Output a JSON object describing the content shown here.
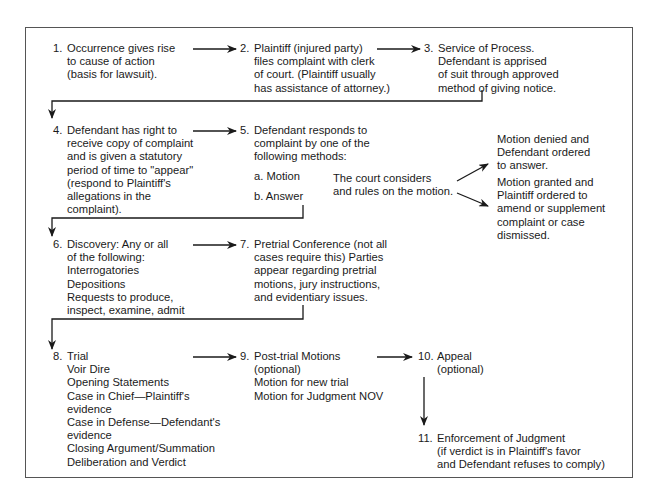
{
  "diagram": {
    "steps": [
      {
        "id": 1,
        "num": "1.",
        "lines": [
          "Occurrence gives rise",
          "to cause of action",
          "(basis for lawsuit)."
        ]
      },
      {
        "id": 2,
        "num": "2.",
        "lines": [
          "Plaintiff (injured party)",
          "files complaint with clerk",
          "of court. (Plaintiff usually",
          "has assistance of attorney.)"
        ]
      },
      {
        "id": 3,
        "num": "3.",
        "lines": [
          "Service of Process.",
          "Defendant is apprised",
          "of suit through approved",
          "method of giving notice."
        ]
      },
      {
        "id": 4,
        "num": "4.",
        "lines": [
          "Defendant has right to",
          "receive copy of complaint",
          "and is given a statutory",
          "period of time to \"appear\"",
          "(respond to Plaintiff's",
          "allegations in the",
          "complaint)."
        ]
      },
      {
        "id": 5,
        "num": "5.",
        "lines": [
          "Defendant responds to",
          "complaint by one of the",
          "following methods:"
        ],
        "options": [
          "a. Motion",
          "b. Answer"
        ]
      },
      {
        "id": 6,
        "num": "6.",
        "lines": [
          "Discovery: Any or all",
          "of the following:",
          "Interrogatories",
          "Depositions",
          "Requests to produce,",
          "inspect, examine, admit"
        ]
      },
      {
        "id": 7,
        "num": "7.",
        "lines": [
          "Pretrial Conference (not all",
          "cases require this) Parties",
          "appear regarding pretrial",
          "motions, jury instructions,",
          "and evidentiary issues."
        ]
      },
      {
        "id": 8,
        "num": "8.",
        "lines": [
          "Trial",
          "Voir Dire",
          "Opening Statements",
          "Case in Chief—Plaintiff's",
          "evidence",
          "Case in Defense—Defendant's",
          "evidence",
          "Closing Argument/Summation",
          "Deliberation and Verdict"
        ]
      },
      {
        "id": 9,
        "num": "9.",
        "lines": [
          "Post-trial Motions",
          "(optional)",
          "Motion for new trial",
          "Motion for Judgment NOV"
        ]
      },
      {
        "id": 10,
        "num": "10.",
        "lines": [
          "Appeal",
          "(optional)"
        ]
      },
      {
        "id": 11,
        "num": "11.",
        "lines": [
          "Enforcement of Judgment",
          "(if verdict is in Plaintiff's favor",
          "and Defendant refuses to comply)"
        ]
      }
    ],
    "motion_note": [
      "The court considers",
      "and rules on the motion."
    ],
    "outcomes": {
      "denied": [
        "Motion denied and",
        "Defendant ordered",
        "to answer."
      ],
      "granted": [
        "Motion granted and",
        "Plaintiff ordered to",
        "amend or supplement",
        "complaint or case",
        "dismissed."
      ]
    },
    "colors": {
      "line": "#1a1a1a",
      "frame": "#555555",
      "text": "#1a1a1a",
      "background": "#ffffff"
    }
  }
}
